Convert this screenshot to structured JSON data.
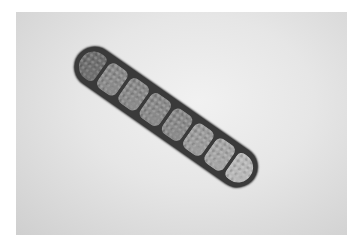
{
  "image": {
    "subject": "multi-celled fungal spore (micrograph)",
    "cell_count": 8,
    "colors": {
      "background": "#e6e6e6",
      "border": "#ffffff",
      "spore_wall": "#3a3a3a",
      "cell_fill": "#8a8a8a"
    }
  }
}
